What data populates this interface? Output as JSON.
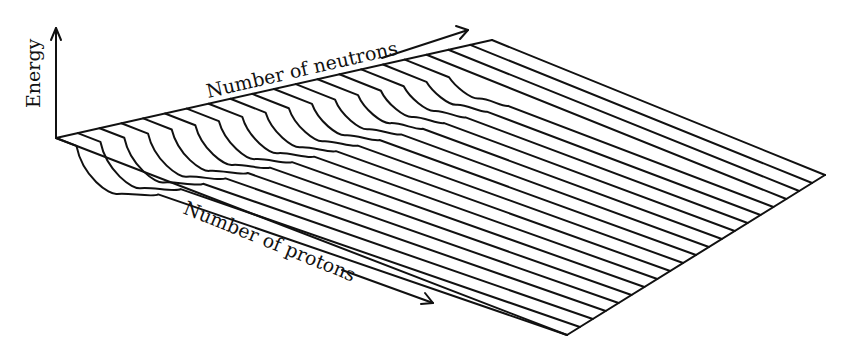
{
  "labels": {
    "energy": "Energy",
    "neutrons": "Number of neutrons",
    "protons": "Number of protons"
  },
  "colors": {
    "ink": "#111111",
    "background": "#ffffff"
  },
  "geometry": {
    "origin": [
      56,
      138
    ],
    "energy_axis_top": [
      56,
      28
    ],
    "back_far_corner": [
      492,
      40
    ],
    "front_near_corner": [
      567,
      335
    ],
    "right_back_corner": [
      825,
      110
    ],
    "right_front_corner": [
      825,
      175
    ],
    "line_count": 21,
    "neutron_arrow": {
      "from": [
        382,
        58
      ],
      "to": [
        468,
        30
      ]
    },
    "proton_arrow": {
      "from": [
        342,
        270
      ],
      "to": [
        433,
        303
      ]
    }
  },
  "chart_data": {
    "type": "surface-wireframe",
    "title": "",
    "xlabel": "Number of neutrons",
    "ylabel": "Number of protons",
    "zlabel": "Energy",
    "profiles": 21
  }
}
